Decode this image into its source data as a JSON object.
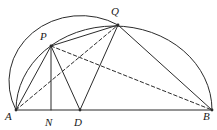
{
  "figure": {
    "canvas": {
      "width": 217,
      "height": 130
    },
    "stroke_color": "#2b2b2b",
    "label_color": "#1a1a1a",
    "background": "#ffffff",
    "points": [
      {
        "id": "A",
        "label": "A",
        "x": 16,
        "y": 110,
        "label_x": 5,
        "label_y": 111
      },
      {
        "id": "N",
        "label": "N",
        "x": 51,
        "y": 110,
        "label_x": 45,
        "label_y": 117
      },
      {
        "id": "D",
        "label": "D",
        "x": 80,
        "y": 110,
        "label_x": 74,
        "label_y": 117
      },
      {
        "id": "B",
        "label": "B",
        "x": 212,
        "y": 110,
        "label_x": 203,
        "label_y": 111
      },
      {
        "id": "P",
        "label": "P",
        "x": 51,
        "y": 46,
        "label_x": 40,
        "label_y": 31
      },
      {
        "id": "Q",
        "label": "Q",
        "x": 118,
        "y": 25,
        "label_x": 111,
        "label_y": 6
      }
    ],
    "solid_segments": [
      {
        "name": "segment-A-B",
        "from": "A",
        "to": "B"
      },
      {
        "name": "segment-A-P",
        "from": "A",
        "to": "P"
      },
      {
        "name": "segment-P-N",
        "from": "P",
        "to": "N"
      },
      {
        "name": "segment-P-D",
        "from": "P",
        "to": "D"
      },
      {
        "name": "segment-P-Q",
        "from": "P",
        "to": "Q"
      },
      {
        "name": "segment-Q-D",
        "from": "Q",
        "to": "D"
      },
      {
        "name": "segment-Q-B",
        "from": "Q",
        "to": "B"
      }
    ],
    "dashed_segments": [
      {
        "name": "segment-A-Q",
        "from": "A",
        "to": "Q"
      },
      {
        "name": "segment-P-B",
        "from": "P",
        "to": "B"
      }
    ],
    "arcs": [
      {
        "name": "semicircle-A-B",
        "from": "A",
        "to": "B",
        "rx": 98,
        "ry": 84,
        "style": "solid"
      },
      {
        "name": "arc-A-Q",
        "from": "A",
        "to": "Q",
        "rx": 72,
        "ry": 66,
        "style": "solid"
      }
    ]
  }
}
